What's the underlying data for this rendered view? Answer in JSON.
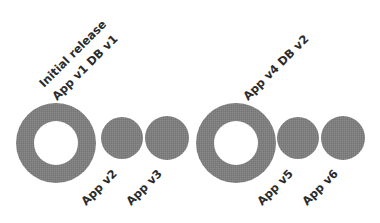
{
  "diagram": {
    "type": "release-timeline",
    "background_color": "#ffffff",
    "shape_fill_color": "#7e7e7e",
    "shape_hole_color": "#ffffff",
    "label_color": "#2b2b2b",
    "label_rotation_degrees": -45,
    "label_font_size": 11.5,
    "nodes": [
      {
        "id": "release-1",
        "shape": "donut",
        "label_lines": [
          "Initial release",
          "App v1 DB v1"
        ],
        "label_position": "above",
        "cx": 56,
        "cy": 143,
        "outer_radius": 40,
        "inner_radius": 22
      },
      {
        "id": "release-2",
        "shape": "circle",
        "label_lines": [
          "App v2"
        ],
        "label_position": "below",
        "cx": 122,
        "cy": 138,
        "outer_radius": 21,
        "inner_radius": 0
      },
      {
        "id": "release-3",
        "shape": "circle",
        "label_lines": [
          "App v3"
        ],
        "label_position": "below",
        "cx": 167,
        "cy": 138,
        "outer_radius": 22,
        "inner_radius": 0
      },
      {
        "id": "release-4",
        "shape": "donut",
        "label_lines": [
          "App v4 DB v2"
        ],
        "label_position": "above",
        "cx": 236,
        "cy": 143,
        "outer_radius": 40,
        "inner_radius": 22
      },
      {
        "id": "release-5",
        "shape": "circle",
        "label_lines": [
          "App v5"
        ],
        "label_position": "below",
        "cx": 298,
        "cy": 138,
        "outer_radius": 21,
        "inner_radius": 0
      },
      {
        "id": "release-6",
        "shape": "circle",
        "label_lines": [
          "App v6"
        ],
        "label_position": "below",
        "cx": 343,
        "cy": 138,
        "outer_radius": 22,
        "inner_radius": 0
      }
    ],
    "labels": [
      {
        "id": "label-release-1-line-1",
        "text": "Initial release",
        "x": 44,
        "y": 88
      },
      {
        "id": "label-release-1-line-2",
        "text": "App v1 DB v1",
        "x": 57,
        "y": 101
      },
      {
        "id": "label-release-2",
        "text": "App v2",
        "x": 86,
        "y": 206
      },
      {
        "id": "label-release-3",
        "text": "App v3",
        "x": 131,
        "y": 206
      },
      {
        "id": "label-release-4",
        "text": "App v4 DB v2",
        "x": 248,
        "y": 101
      },
      {
        "id": "label-release-5",
        "text": "App v5",
        "x": 262,
        "y": 206
      },
      {
        "id": "label-release-6",
        "text": "App v6",
        "x": 307,
        "y": 206
      }
    ]
  }
}
